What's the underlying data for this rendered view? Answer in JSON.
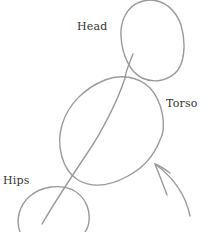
{
  "diagram": {
    "type": "figure-construction-sketch",
    "labels": {
      "head": "Head",
      "torso": "Torso",
      "hips": "Hips"
    },
    "stroke_color": "#9a9a9a",
    "text_color": "#333333",
    "background": "#ffffff"
  }
}
